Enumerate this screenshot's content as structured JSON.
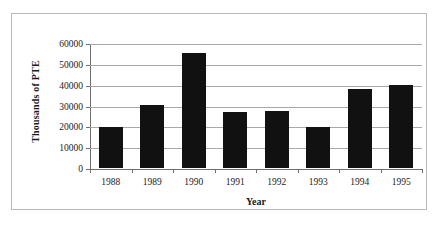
{
  "chart_data": {
    "type": "bar",
    "title": "",
    "xlabel": "Year",
    "ylabel": "Thousands of PTE",
    "categories": [
      "1988",
      "1989",
      "1990",
      "1991",
      "1992",
      "1993",
      "1994",
      "1995"
    ],
    "values": [
      19600,
      30200,
      55000,
      26800,
      27200,
      19800,
      37800,
      40000
    ],
    "series": [
      {
        "name": "Thousands of PTE",
        "values": [
          19600,
          30200,
          55000,
          26800,
          27200,
          19800,
          37800,
          40000
        ]
      }
    ],
    "ylim": [
      0,
      60000
    ],
    "ytick_labels": [
      "0",
      "10000",
      "20000",
      "30000",
      "40000",
      "50000",
      "60000"
    ],
    "ytick_values": [
      0,
      10000,
      20000,
      30000,
      40000,
      50000,
      60000
    ],
    "grid": true,
    "legend": "none",
    "bar_color": "#111111",
    "gridline_color": "#a8a8a8",
    "axis_color": "#6f6f6f",
    "background_color": "#ffffff",
    "frame_color": "#b9b9b9"
  }
}
